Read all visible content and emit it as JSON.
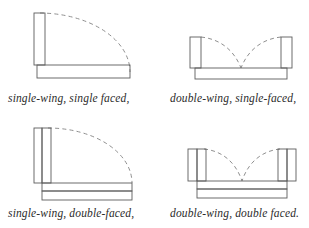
{
  "figure": {
    "background_color": "#ffffff",
    "stroke_color": "#585858",
    "dashed_color": "#8a8a8a",
    "text_color": "#2b2b2b",
    "layout": "2x2 grid of line drawings, each with an italic caption below"
  },
  "panels": [
    {
      "id": "single-wing-single-faced",
      "position": "top-left",
      "caption": "single-wing, single faced,",
      "wings": 1,
      "wing_thickness": "single",
      "facing": "single",
      "arc_count": 1,
      "description": "One vertical wing at left, single-thickness horizontal base at bottom, one dashed quarter-arc sweeping from wing top to base right end."
    },
    {
      "id": "double-wing-single-faced",
      "position": "top-right",
      "caption": "double-wing, single-faced,",
      "wings": 2,
      "wing_thickness": "single",
      "facing": "single",
      "arc_count": 2,
      "description": "Two vertical wings at left and right, single-thickness horizontal base at bottom, two dashed arcs meeting at the center."
    },
    {
      "id": "single-wing-double-faced",
      "position": "bottom-left",
      "caption": "single-wing, double-faced,",
      "wings": 1,
      "wing_thickness": "double",
      "facing": "double",
      "arc_count": 1,
      "description": "One double-thickness vertical wing at left, double-thickness horizontal base at bottom, one dashed quarter-arc."
    },
    {
      "id": "double-wing-double-faced",
      "position": "bottom-right",
      "caption": "double-wing, double faced.",
      "wings": 2,
      "wing_thickness": "double",
      "facing": "double",
      "arc_count": 2,
      "description": "Two double-thickness vertical wings, double-thickness horizontal base, two dashed arcs meeting at the center."
    }
  ]
}
